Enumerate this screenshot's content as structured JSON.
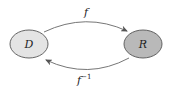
{
  "diagram": {
    "nodes": [
      {
        "id": "D",
        "label": "D",
        "fill": "#e4e4e4",
        "stroke": "#555555"
      },
      {
        "id": "R",
        "label": "R",
        "fill": "#b9b9b9",
        "stroke": "#555555"
      }
    ],
    "edges": [
      {
        "from": "D",
        "to": "R",
        "label": "f",
        "superscript": ""
      },
      {
        "from": "R",
        "to": "D",
        "label": "f",
        "superscript": "−1"
      }
    ],
    "colors": {
      "line": "#555555",
      "background": "#ffffff"
    }
  }
}
